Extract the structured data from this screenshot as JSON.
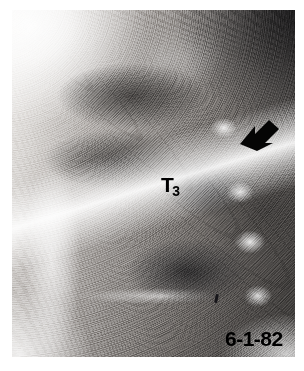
{
  "figure": {
    "kind": "radiograph",
    "modality": "x-ray",
    "view": "lateral cervicothoracic spine",
    "background_color": "#ffffff",
    "plate": {
      "left": 12,
      "top": 10,
      "width": 283,
      "height": 347,
      "base_color": "#6e6e6e",
      "highlight_color": "#ffffff",
      "shadow_color": "#231f1e"
    }
  },
  "annotations": {
    "vertebra": {
      "name": "vertebra-level-label",
      "base": "T",
      "subscript": "3",
      "full_text": "T3",
      "color": "#000000",
      "x": 149,
      "y": 164
    },
    "date_stamp": {
      "name": "exam-date-stamp",
      "text": "6-1-82",
      "color": "#000000",
      "x": 213,
      "y": 318
    },
    "arrow": {
      "name": "pointer-arrow",
      "icon": "arrow-icon",
      "direction": "down-left",
      "color": "#000000",
      "x": 226,
      "y": 104
    },
    "tick": {
      "name": "tick-marker",
      "icon": "tick-mark-icon",
      "color": "#17161a",
      "x": 203,
      "y": 284
    }
  }
}
